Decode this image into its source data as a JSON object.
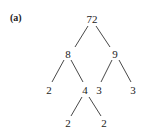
{
  "panel_label": "(a)",
  "tree": {
    "nodes": [
      {
        "id": "n72",
        "value": "72",
        "x": 92,
        "y": 19
      },
      {
        "id": "n8",
        "value": "8",
        "x": 68,
        "y": 54
      },
      {
        "id": "n9",
        "value": "9",
        "x": 115,
        "y": 54
      },
      {
        "id": "n2a",
        "value": "2",
        "x": 49,
        "y": 90
      },
      {
        "id": "n4",
        "value": "4",
        "x": 85,
        "y": 90
      },
      {
        "id": "n3a",
        "value": "3",
        "x": 99,
        "y": 90
      },
      {
        "id": "n3b",
        "value": "3",
        "x": 133,
        "y": 90
      },
      {
        "id": "n2b",
        "value": "2",
        "x": 68,
        "y": 123
      },
      {
        "id": "n2c",
        "value": "2",
        "x": 104,
        "y": 123
      }
    ],
    "edges": [
      {
        "from": "72",
        "to": "8"
      },
      {
        "from": "72",
        "to": "9"
      },
      {
        "from": "8",
        "to": "2"
      },
      {
        "from": "8",
        "to": "4"
      },
      {
        "from": "9",
        "to": "3"
      },
      {
        "from": "9",
        "to": "3"
      },
      {
        "from": "4",
        "to": "2"
      },
      {
        "from": "4",
        "to": "2"
      }
    ]
  },
  "colors": {
    "ink": "#222222",
    "background": "#ffffff"
  }
}
